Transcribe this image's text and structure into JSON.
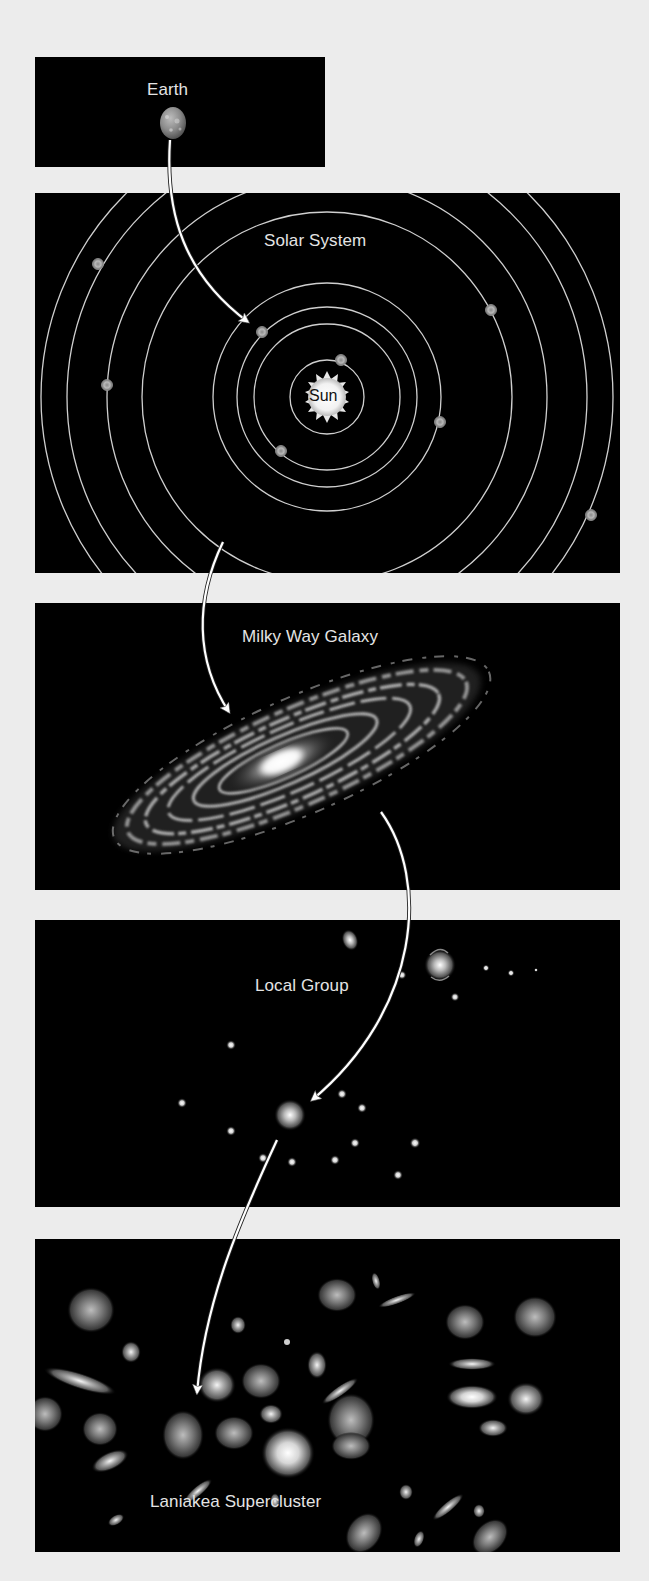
{
  "diagram": {
    "type": "cosmic-address-hierarchy",
    "panels": [
      {
        "id": "earth",
        "label": "Earth"
      },
      {
        "id": "solar-system",
        "label": "Solar System",
        "center_label": "Sun"
      },
      {
        "id": "milky-way",
        "label": "Milky Way Galaxy"
      },
      {
        "id": "local-group",
        "label": "Local Group"
      },
      {
        "id": "laniakea",
        "label": "Laniakea Supercluster"
      }
    ],
    "arrows": [
      {
        "from": "earth",
        "to": "solar-system"
      },
      {
        "from": "solar-system",
        "to": "milky-way"
      },
      {
        "from": "milky-way",
        "to": "local-group"
      },
      {
        "from": "local-group",
        "to": "laniakea"
      }
    ]
  },
  "colors": {
    "page_background": "#ececec",
    "panel_background": "#000000",
    "label_text": "#e4e4e4",
    "orbit_line": "#cfcfcf",
    "arrow": "#ffffff"
  }
}
